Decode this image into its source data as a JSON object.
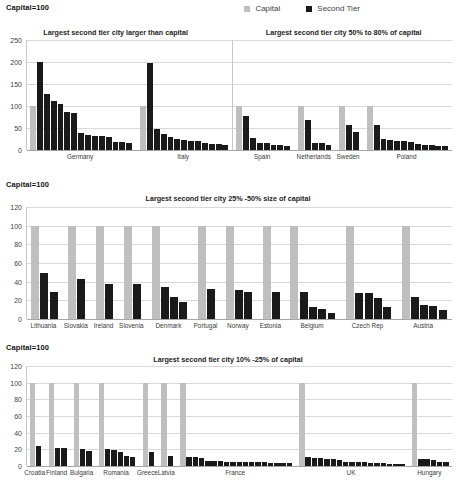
{
  "figure": {
    "capital_note": "Capital=100",
    "legend": [
      {
        "label": "Capital",
        "color": "#bfbfbf",
        "key": "capital"
      },
      {
        "label": "Second Tier",
        "color": "#1a1a1a",
        "key": "second_tier"
      }
    ]
  },
  "chart_data": [
    {
      "type": "bar",
      "panel_index": 0,
      "title": "",
      "subtitles": [
        "Largest second tier city larger than capital",
        "Largest second tier city 50% to 80% of capital"
      ],
      "ylabel": "",
      "xlabel": "",
      "ylim": [
        0,
        250
      ],
      "yticks": [
        0,
        50,
        100,
        150,
        200,
        250
      ],
      "grid": true,
      "legend_position": "top",
      "divider_after_group": 1,
      "categories": [
        "Germany",
        "Italy",
        "Spain",
        "Netherlands",
        "Sweden",
        "Poland"
      ],
      "groups": [
        {
          "name": "Germany",
          "capital": 100,
          "second_tier": [
            201,
            127,
            111,
            104,
            87,
            84,
            39,
            34,
            32,
            31,
            30,
            19,
            18,
            15
          ]
        },
        {
          "name": "Italy",
          "capital": 100,
          "second_tier": [
            198,
            47,
            36,
            29,
            25,
            22,
            21,
            20,
            16,
            14,
            13,
            12
          ]
        },
        {
          "name": "Spain",
          "capital": 100,
          "second_tier": [
            77,
            27,
            17,
            15,
            12,
            11,
            10
          ]
        },
        {
          "name": "Netherlands",
          "capital": 100,
          "second_tier": [
            68,
            16,
            15,
            12
          ]
        },
        {
          "name": "Sweden",
          "capital": 100,
          "second_tier": [
            56,
            40
          ]
        },
        {
          "name": "Poland",
          "capital": 100,
          "second_tier": [
            56,
            24,
            22,
            21,
            20,
            18,
            13,
            12,
            11,
            9,
            8
          ]
        }
      ]
    },
    {
      "type": "bar",
      "panel_index": 1,
      "title": "Largest second tier city 25% -50% size of capital",
      "subtitles": [
        "Largest second tier city 25% -50% size of capital"
      ],
      "ylabel": "",
      "xlabel": "",
      "ylim": [
        0,
        120
      ],
      "yticks": [
        0,
        20,
        40,
        60,
        80,
        100,
        120
      ],
      "grid": true,
      "legend_position": "none",
      "categories": [
        "Lithuania",
        "Slovakia",
        "Ireland",
        "Slovenia",
        "Denmark",
        "Portugal",
        "Norway",
        "Estonia",
        "Belgium",
        "Czech Rep",
        "Austria"
      ],
      "groups": [
        {
          "name": "Lithuania",
          "capital": 100,
          "second_tier": [
            49,
            29
          ]
        },
        {
          "name": "Slovakia",
          "capital": 100,
          "second_tier": [
            43
          ]
        },
        {
          "name": "Ireland",
          "capital": 100,
          "second_tier": [
            38
          ]
        },
        {
          "name": "Slovenia",
          "capital": 100,
          "second_tier": [
            38
          ]
        },
        {
          "name": "Denmark",
          "capital": 100,
          "second_tier": [
            34,
            24,
            18
          ]
        },
        {
          "name": "Portugal",
          "capital": 100,
          "second_tier": [
            32
          ]
        },
        {
          "name": "Norway",
          "capital": 100,
          "second_tier": [
            31,
            29
          ]
        },
        {
          "name": "Estonia",
          "capital": 100,
          "second_tier": [
            29
          ]
        },
        {
          "name": "Belgium",
          "capital": 100,
          "second_tier": [
            29,
            13,
            11,
            6
          ]
        },
        {
          "name": "Czech Rep",
          "capital": 100,
          "second_tier": [
            28,
            28,
            23,
            13
          ]
        },
        {
          "name": "Austria",
          "capital": 100,
          "second_tier": [
            24,
            15,
            14,
            10
          ]
        }
      ]
    },
    {
      "type": "bar",
      "panel_index": 2,
      "title": "Largest second tier city 10% -25% of capital",
      "subtitles": [
        "Largest second tier city 10% -25% of capital"
      ],
      "ylabel": "",
      "xlabel": "",
      "ylim": [
        0,
        120
      ],
      "yticks": [
        0,
        20,
        40,
        60,
        80,
        100,
        120
      ],
      "grid": true,
      "legend_position": "none",
      "categories": [
        "Croatia",
        "Finland",
        "Bulgaria",
        "Romania",
        "Greece",
        "Latvia",
        "France",
        "UK",
        "Hungary"
      ],
      "groups": [
        {
          "name": "Croatia",
          "capital": 100,
          "second_tier": [
            24
          ]
        },
        {
          "name": "Finland",
          "capital": 100,
          "second_tier": [
            22,
            22
          ]
        },
        {
          "name": "Bulgaria",
          "capital": 100,
          "second_tier": [
            20,
            18
          ]
        },
        {
          "name": "Romania",
          "capital": 100,
          "second_tier": [
            20,
            19,
            17,
            12,
            11
          ]
        },
        {
          "name": "Greece",
          "capital": 100,
          "second_tier": [
            17
          ]
        },
        {
          "name": "Latvia",
          "capital": 100,
          "second_tier": [
            12
          ]
        },
        {
          "name": "France",
          "capital": 100,
          "second_tier": [
            11,
            11,
            10,
            6,
            6,
            6,
            5,
            5,
            5,
            5,
            5,
            5,
            5,
            4,
            4,
            4,
            4
          ]
        },
        {
          "name": "UK",
          "capital": 100,
          "second_tier": [
            11,
            10,
            10,
            9,
            9,
            7,
            5,
            5,
            5,
            5,
            4,
            4,
            4,
            3,
            3,
            2
          ]
        },
        {
          "name": "Hungary",
          "capital": 100,
          "second_tier": [
            8,
            8,
            7,
            5,
            5
          ]
        }
      ]
    }
  ]
}
